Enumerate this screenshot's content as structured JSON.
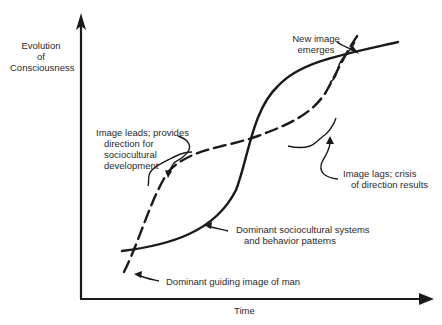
{
  "diagram": {
    "y_axis_label": [
      "Evolution",
      "of",
      "Consciousness"
    ],
    "x_axis_label": "Time",
    "annotations": {
      "new_image": [
        "New image",
        "emerges"
      ],
      "image_leads": [
        "Image leads; provides",
        "direction for",
        "sociocultural",
        "development"
      ],
      "image_lags": [
        "Image lags; crisis",
        "of direction results"
      ],
      "sociocultural": [
        "Dominant sociocultural systems",
        "and behavior patterns"
      ],
      "guiding_image": "Dominant guiding image of man"
    },
    "series": [
      {
        "name": "Dominant sociocultural systems and behavior patterns",
        "style": "solid"
      },
      {
        "name": "Dominant guiding image of man",
        "style": "dashed"
      }
    ],
    "colors": {
      "ink": "#1a1a1a",
      "background": "#ffffff"
    }
  }
}
